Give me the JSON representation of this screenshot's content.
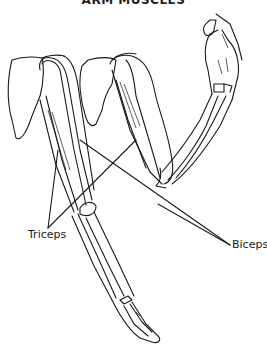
{
  "diagram": {
    "title": "ARM MUSCLES",
    "labels": {
      "triceps": "Triceps",
      "biceps": "Biceps"
    },
    "colors": {
      "line": "#1a1a1a",
      "background": "#ffffff"
    }
  }
}
